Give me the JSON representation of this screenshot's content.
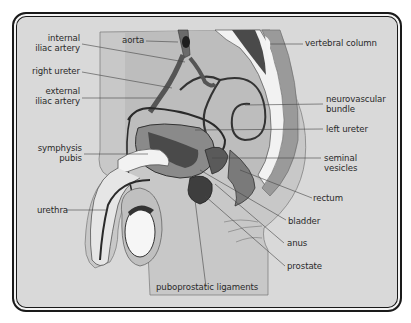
{
  "figure": {
    "type": "anatomical cross-section",
    "colors": {
      "background": "#d9d9d9",
      "frame": "#1a1a1a",
      "vessel": "#3a3a3a",
      "organ_dark": "#4a4a4a",
      "organ_mid": "#8a8a8a",
      "bone": "#f2f2f2",
      "leader": "#444444"
    }
  },
  "labels": {
    "internal_iliac_artery": {
      "line1": "internal",
      "line2": "iliac artery"
    },
    "aorta": "aorta",
    "vertebral_column": "vertebral column",
    "right_ureter": "right ureter",
    "external_iliac_artery": {
      "line1": "external",
      "line2": "iliac artery"
    },
    "neurovascular_bundle": {
      "line1": "neurovascular",
      "line2": "bundle"
    },
    "left_ureter": "left ureter",
    "symphysis_pubis": {
      "line1": "symphysis",
      "line2": "pubis"
    },
    "seminal_vesicles": {
      "line1": "seminal",
      "line2": "vesicles"
    },
    "rectum": "rectum",
    "urethra": "urethra",
    "bladder": "bladder",
    "anus": "anus",
    "prostate": "prostate",
    "puboprostatic_ligaments": "puboprostatic ligaments"
  }
}
